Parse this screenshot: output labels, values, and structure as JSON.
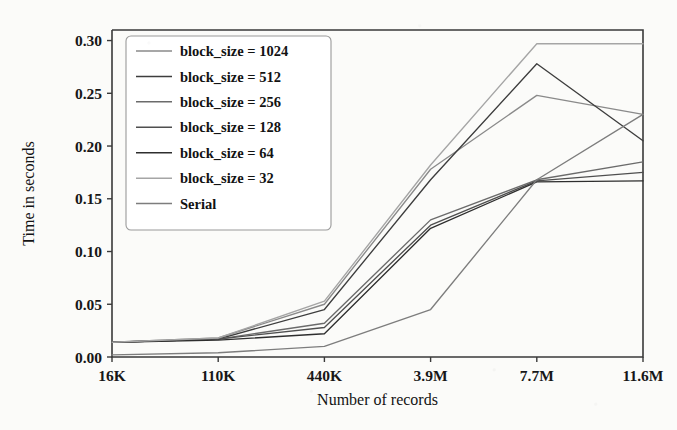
{
  "chart_data": {
    "type": "line",
    "title": "",
    "xlabel": "Number of records",
    "ylabel": "Time in seconds",
    "categories": [
      "16K",
      "110K",
      "440K",
      "3.9M",
      "7.7M",
      "11.6M"
    ],
    "x_tick_labels": [
      "16K",
      "110K",
      "440K",
      "3.9M",
      "7.7M",
      "11.6M"
    ],
    "y_tick_labels": [
      "0.00",
      "0.05",
      "0.10",
      "0.15",
      "0.20",
      "0.25",
      "0.30"
    ],
    "y_ticks": [
      0.0,
      0.05,
      0.1,
      0.15,
      0.2,
      0.25,
      0.3
    ],
    "ylim": [
      0.0,
      0.31
    ],
    "xlim": [
      0,
      5
    ],
    "grid": false,
    "legend_position": "upper left",
    "series": [
      {
        "name": "block_size = 1024",
        "color": "#8a8a8a",
        "values": [
          0.014,
          0.018,
          0.05,
          0.178,
          0.248,
          0.23
        ]
      },
      {
        "name": "block_size = 512",
        "color": "#3d3d3d",
        "values": [
          0.014,
          0.017,
          0.045,
          0.168,
          0.278,
          0.205
        ]
      },
      {
        "name": "block_size = 256",
        "color": "#6b6b6b",
        "values": [
          0.014,
          0.017,
          0.032,
          0.13,
          0.168,
          0.185
        ]
      },
      {
        "name": "block_size = 128",
        "color": "#4f4f4f",
        "values": [
          0.014,
          0.017,
          0.028,
          0.125,
          0.167,
          0.175
        ]
      },
      {
        "name": "block_size = 64",
        "color": "#2e2e2e",
        "values": [
          0.014,
          0.016,
          0.022,
          0.122,
          0.166,
          0.167
        ]
      },
      {
        "name": "block_size = 32",
        "color": "#a5a5a5",
        "values": [
          0.014,
          0.018,
          0.053,
          0.182,
          0.297,
          0.297
        ]
      },
      {
        "name": "Serial",
        "color": "#7d7d7d",
        "values": [
          0.002,
          0.004,
          0.01,
          0.045,
          0.168,
          0.23
        ]
      }
    ]
  },
  "legend": {
    "entries": [
      "block_size = 1024",
      "block_size = 512",
      "block_size = 256",
      "block_size = 128",
      "block_size = 64",
      "block_size = 32",
      "Serial"
    ]
  },
  "axes": {
    "x_title": "Number of records",
    "y_title": "Time in seconds"
  }
}
